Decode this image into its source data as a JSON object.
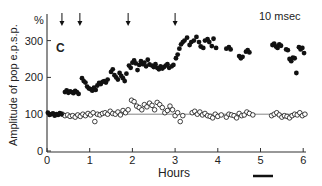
{
  "chart_data": {
    "type": "scatter",
    "panel_label": "C",
    "annotation": "10 msec",
    "title": "",
    "xlabel": "Hours",
    "ylabel": "Amplitude of pop e.p.s.p.",
    "yunit": "%",
    "xlim": [
      0,
      6.2
    ],
    "ylim": [
      0,
      330
    ],
    "xticks": [
      0,
      1,
      2,
      3,
      4,
      5,
      6
    ],
    "yticks": [
      0,
      100,
      200,
      300
    ],
    "grid": false,
    "legend": "none",
    "reference_line": {
      "y": 100,
      "x_from": 0,
      "x_to": 6.1
    },
    "arrows_at_hours": [
      0.35,
      0.77,
      1.9,
      3.0
    ],
    "scale_bar": {
      "x_from_hours": 4.85,
      "x_to_hours": 5.3,
      "label": ""
    },
    "series": [
      {
        "name": "tetanized pathway",
        "marker": "filled-circle",
        "x": [
          0.02,
          0.06,
          0.1,
          0.14,
          0.18,
          0.22,
          0.26,
          0.3,
          0.34,
          0.42,
          0.46,
          0.5,
          0.54,
          0.58,
          0.62,
          0.66,
          0.7,
          0.74,
          0.82,
          0.86,
          0.9,
          0.94,
          0.98,
          1.02,
          1.06,
          1.1,
          1.14,
          1.18,
          1.22,
          1.26,
          1.3,
          1.34,
          1.38,
          1.42,
          1.5,
          1.54,
          1.58,
          1.62,
          1.66,
          1.7,
          1.74,
          1.78,
          1.82,
          1.86,
          1.92,
          1.96,
          2.0,
          2.04,
          2.08,
          2.12,
          2.16,
          2.2,
          2.24,
          2.28,
          2.32,
          2.36,
          2.4,
          2.46,
          2.5,
          2.54,
          2.58,
          2.62,
          2.66,
          2.7,
          2.74,
          2.78,
          2.82,
          2.86,
          2.92,
          2.96,
          3.02,
          3.06,
          3.1,
          3.14,
          3.18,
          3.22,
          3.28,
          3.34,
          3.38,
          3.44,
          3.5,
          3.56,
          3.6,
          3.66,
          3.7,
          3.76,
          3.8,
          3.86,
          3.9,
          3.96,
          4.2,
          4.26,
          4.3,
          4.5,
          4.54,
          4.58,
          4.66,
          4.7,
          4.74,
          5.28,
          5.32,
          5.36,
          5.4,
          5.44,
          5.48,
          5.6,
          5.64,
          5.68,
          5.72,
          5.76,
          5.8,
          5.84,
          5.9,
          5.94,
          5.98,
          6.02
        ],
        "y": [
          104,
          98,
          100,
          102,
          96,
          100,
          98,
          103,
          100,
          160,
          165,
          158,
          162,
          160,
          157,
          163,
          160,
          155,
          198,
          190,
          186,
          175,
          170,
          168,
          164,
          172,
          166,
          178,
          185,
          182,
          188,
          190,
          186,
          194,
          215,
          222,
          206,
          200,
          194,
          212,
          204,
          198,
          190,
          210,
          232,
          226,
          240,
          246,
          238,
          220,
          234,
          244,
          236,
          240,
          230,
          248,
          235,
          232,
          228,
          236,
          226,
          222,
          230,
          224,
          228,
          232,
          236,
          226,
          230,
          234,
          252,
          262,
          278,
          290,
          296,
          300,
          308,
          288,
          296,
          300,
          310,
          296,
          284,
          280,
          300,
          304,
          296,
          285,
          305,
          280,
          278,
          282,
          276,
          258,
          252,
          256,
          270,
          274,
          268,
          288,
          292,
          284,
          280,
          290,
          286,
          276,
          274,
          250,
          244,
          254,
          252,
          212,
          282,
          276,
          280,
          266
        ],
        "color": "#111111"
      },
      {
        "name": "control pathway",
        "marker": "open-circle",
        "x": [
          0.36,
          0.42,
          0.48,
          0.54,
          0.6,
          0.66,
          0.72,
          0.78,
          0.84,
          0.9,
          0.96,
          1.02,
          1.08,
          1.12,
          1.18,
          1.24,
          1.3,
          1.36,
          1.42,
          1.48,
          1.54,
          1.6,
          1.66,
          1.72,
          1.78,
          1.84,
          1.9,
          1.98,
          2.04,
          2.1,
          2.16,
          2.22,
          2.28,
          2.34,
          2.4,
          2.46,
          2.52,
          2.58,
          2.64,
          2.7,
          2.76,
          2.82,
          2.88,
          2.94,
          3.0,
          3.06,
          3.12,
          3.18,
          3.4,
          3.46,
          3.52,
          3.58,
          3.64,
          3.7,
          3.76,
          3.82,
          3.88,
          3.94,
          4.0,
          4.08,
          4.2,
          4.26,
          4.32,
          4.38,
          4.44,
          4.5,
          4.56,
          4.62,
          4.68,
          4.74,
          4.82,
          5.26,
          5.32,
          5.38,
          5.44,
          5.5,
          5.56,
          5.62,
          5.68,
          5.74,
          5.8,
          5.86,
          5.92,
          5.98,
          6.04
        ],
        "y": [
          100,
          96,
          98,
          94,
          96,
          92,
          98,
          94,
          100,
          96,
          102,
          98,
          104,
          80,
          100,
          98,
          102,
          104,
          100,
          108,
          102,
          100,
          106,
          98,
          110,
          104,
          112,
          138,
          134,
          122,
          118,
          112,
          126,
          120,
          130,
          124,
          112,
          132,
          126,
          118,
          104,
          110,
          122,
          112,
          96,
          104,
          80,
          96,
          104,
          108,
          100,
          106,
          98,
          102,
          96,
          94,
          90,
          100,
          94,
          98,
          92,
          100,
          98,
          96,
          90,
          102,
          96,
          98,
          106,
          102,
          98,
          96,
          100,
          104,
          98,
          92,
          96,
          94,
          90,
          96,
          100,
          98,
          104,
          96,
          100
        ],
        "color": "#111111"
      }
    ]
  }
}
